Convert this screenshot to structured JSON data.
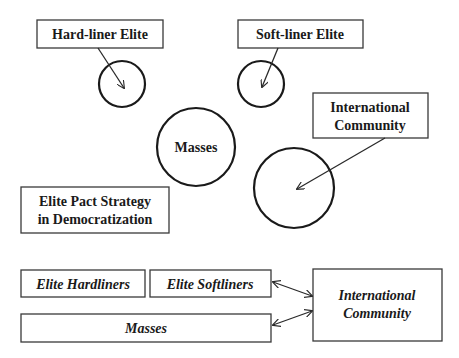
{
  "top_diagram": {
    "hardliner_label": "Hard-liner Elite",
    "softliner_label": "Soft-liner Elite",
    "masses_label": "Masses",
    "international_label_line1": "International",
    "international_label_line2": "Community",
    "title_line1": "Elite Pact Strategy",
    "title_line2": "in Democratization"
  },
  "bottom_diagram": {
    "elite_hardliners": "Elite Hardliners",
    "elite_softliners": "Elite Softliners",
    "masses": "Masses",
    "international_line1": "International",
    "international_line2": "Community"
  },
  "colors": {
    "stroke": "#1a1a1a",
    "background": "#ffffff"
  }
}
